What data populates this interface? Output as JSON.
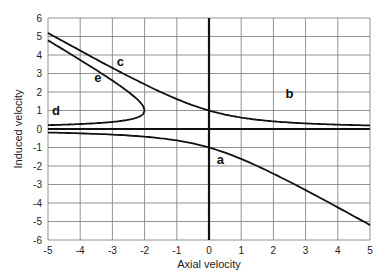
{
  "chart_data": {
    "type": "line",
    "title": "",
    "xlabel": "Axial velocity",
    "ylabel": "Induced velocity",
    "xlim": [
      -5,
      5
    ],
    "ylim": [
      -6,
      6
    ],
    "grid": true,
    "legend": "none (curves labeled inline a–e)",
    "x_ticks": [
      -5,
      -4,
      -3,
      -2,
      -1,
      0,
      1,
      2,
      3,
      4,
      5
    ],
    "y_ticks": [
      -6,
      -5,
      -4,
      -3,
      -2,
      -1,
      0,
      1,
      2,
      3,
      4,
      5,
      6
    ],
    "series": [
      {
        "name": "a",
        "x": [
          -5,
          -4,
          -3,
          -2,
          -1,
          0,
          1,
          2,
          3,
          4,
          5
        ],
        "values": [
          -0.19,
          -0.24,
          -0.3,
          -0.41,
          -0.62,
          -1.0,
          -1.62,
          -2.41,
          -3.3,
          -4.24,
          -5.19
        ]
      },
      {
        "name": "b",
        "x": [
          0,
          1,
          2,
          3,
          4,
          5
        ],
        "values": [
          1.0,
          0.62,
          0.41,
          0.3,
          0.24,
          0.19
        ]
      },
      {
        "name": "c",
        "x": [
          -5,
          -4,
          -3,
          -2,
          -1,
          0
        ],
        "values": [
          5.19,
          4.24,
          3.3,
          2.41,
          1.62,
          1.0
        ]
      },
      {
        "name": "d",
        "x": [
          -5,
          -4,
          -3,
          -2.5,
          -2
        ],
        "values": [
          0.21,
          0.27,
          0.38,
          0.5,
          1.0
        ]
      },
      {
        "name": "e",
        "x": [
          -5,
          -4,
          -3,
          -2.5,
          -2
        ],
        "values": [
          4.79,
          3.73,
          2.62,
          2.0,
          1.0
        ]
      }
    ],
    "reference_lines": [
      {
        "orientation": "horizontal",
        "value": 0
      },
      {
        "orientation": "vertical",
        "value": 0
      }
    ],
    "labels": {
      "a": {
        "x": 0.35,
        "y": -1.9
      },
      "b": {
        "x": 2.5,
        "y": 1.7
      },
      "c": {
        "x": -2.75,
        "y": 3.4
      },
      "d": {
        "x": -4.75,
        "y": 0.75
      },
      "e": {
        "x": -3.45,
        "y": 2.55
      }
    }
  }
}
